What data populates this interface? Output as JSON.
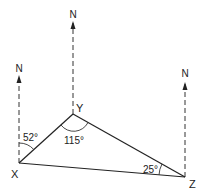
{
  "diagram": {
    "type": "bearing-triangle",
    "colors": {
      "line": "#222222",
      "dashed": "#333333",
      "background": "#ffffff"
    },
    "points": {
      "X": {
        "label": "X",
        "x": 19,
        "y": 163
      },
      "Y": {
        "label": "Y",
        "x": 73,
        "y": 114
      },
      "Z": {
        "label": "Z",
        "x": 185,
        "y": 177
      }
    },
    "north_lines": [
      {
        "at": "X",
        "label": "N"
      },
      {
        "at": "Y",
        "label": "N"
      },
      {
        "at": "Z",
        "label": "N"
      }
    ],
    "angles": {
      "X_bearing": "52°",
      "Y_interior": "115°",
      "Z_interior": "25°"
    }
  }
}
